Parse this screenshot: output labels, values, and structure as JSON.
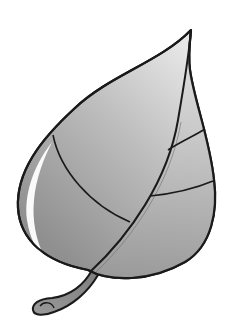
{
  "image": {
    "subject": "leaf illustration",
    "description": "Grayscale clipart of a single leaf with a pointed tip, curved midrib, side veins and a short curled stem",
    "colors": {
      "background": "#ffffff",
      "outline": "#1a1a1a",
      "fill_light": "#e6e6e6",
      "fill_mid": "#b4b4b4",
      "fill_dark": "#8e8e8e",
      "highlight": "#ffffff",
      "stem": "#8a8a8a"
    },
    "parts": [
      "blade",
      "midrib",
      "veins",
      "stem",
      "highlight"
    ]
  }
}
